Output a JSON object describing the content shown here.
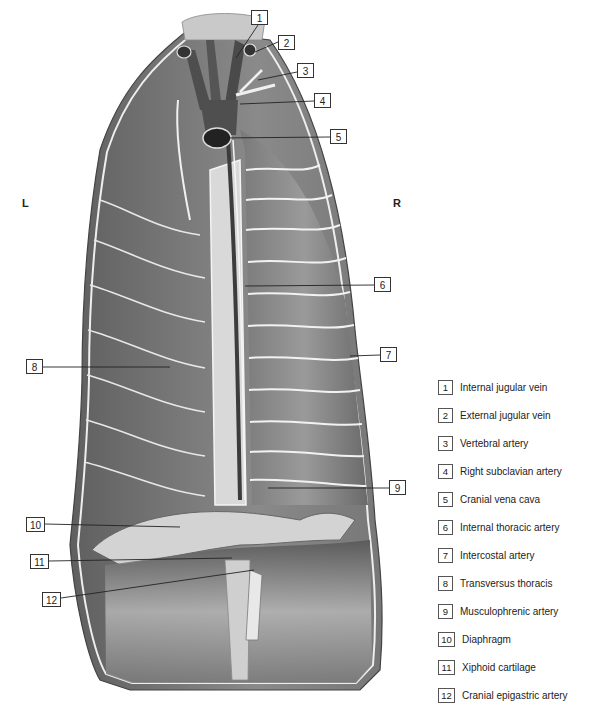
{
  "figure": {
    "orientation": {
      "left": "L",
      "right": "R"
    },
    "callouts": [
      {
        "num": "1",
        "x": 251,
        "y": 10,
        "w": 17,
        "lx1": 258,
        "ly1": 25,
        "lx2": 236,
        "ly2": 58
      },
      {
        "num": "2",
        "x": 278,
        "y": 35,
        "w": 17,
        "lx1": 278,
        "ly1": 42,
        "lx2": 255,
        "ly2": 52
      },
      {
        "num": "3",
        "x": 297,
        "y": 63,
        "w": 17,
        "lx1": 297,
        "ly1": 72,
        "lx2": 258,
        "ly2": 80
      },
      {
        "num": "4",
        "x": 314,
        "y": 93,
        "w": 17,
        "lx1": 314,
        "ly1": 101,
        "lx2": 240,
        "ly2": 104
      },
      {
        "num": "5",
        "x": 330,
        "y": 129,
        "w": 17,
        "lx1": 330,
        "ly1": 137,
        "lx2": 218,
        "ly2": 138
      },
      {
        "num": "6",
        "x": 374,
        "y": 277,
        "w": 17,
        "lx1": 374,
        "ly1": 285,
        "lx2": 245,
        "ly2": 286
      },
      {
        "num": "7",
        "x": 380,
        "y": 347,
        "w": 17,
        "lx1": 380,
        "ly1": 355,
        "lx2": 350,
        "ly2": 356
      },
      {
        "num": "8",
        "x": 26,
        "y": 359,
        "w": 17,
        "lx1": 43,
        "ly1": 367,
        "lx2": 170,
        "ly2": 367
      },
      {
        "num": "9",
        "x": 389,
        "y": 480,
        "w": 17,
        "lx1": 389,
        "ly1": 488,
        "lx2": 268,
        "ly2": 488
      },
      {
        "num": "10",
        "x": 26,
        "y": 517,
        "w": 19,
        "lx1": 45,
        "ly1": 524,
        "lx2": 180,
        "ly2": 527
      },
      {
        "num": "11",
        "x": 30,
        "y": 554,
        "w": 19,
        "lx1": 49,
        "ly1": 561,
        "lx2": 232,
        "ly2": 558
      },
      {
        "num": "12",
        "x": 42,
        "y": 592,
        "w": 19,
        "lx1": 61,
        "ly1": 598,
        "lx2": 254,
        "ly2": 570
      }
    ]
  },
  "legend": {
    "items": [
      {
        "num": "1",
        "label": "Internal jugular vein"
      },
      {
        "num": "2",
        "label": "External jugular vein"
      },
      {
        "num": "3",
        "label": "Vertebral artery"
      },
      {
        "num": "4",
        "label": "Right subclavian artery"
      },
      {
        "num": "5",
        "label": "Cranial vena cava"
      },
      {
        "num": "6",
        "label": "Internal thoracic artery"
      },
      {
        "num": "7",
        "label": "Intercostal artery"
      },
      {
        "num": "8",
        "label": "Transversus thoracis"
      },
      {
        "num": "9",
        "label": "Musculophrenic artery"
      },
      {
        "num": "10",
        "label": "Diaphragm"
      },
      {
        "num": "11",
        "label": "Xiphoid cartilage"
      },
      {
        "num": "12",
        "label": "Cranial epigastric artery"
      }
    ]
  }
}
